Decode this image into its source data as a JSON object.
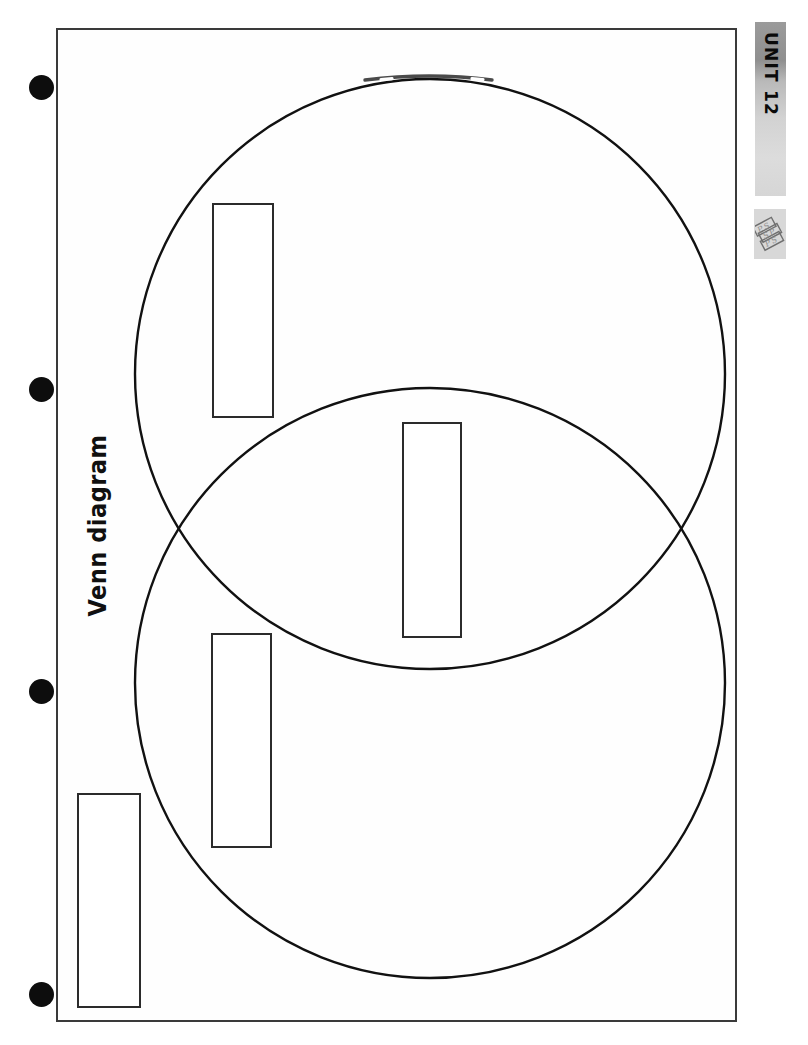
{
  "page": {
    "width": 808,
    "height": 1045,
    "background_color": "#ffffff",
    "border_color": "#3a3a3a"
  },
  "sheet": {
    "title": "Venn diagram",
    "title_rotation_degrees": -90,
    "border": {
      "x": 56,
      "y": 28,
      "width": 681,
      "height": 994
    }
  },
  "unit_tab": {
    "label": "UNIT 12",
    "rotation_degrees": 90,
    "gradient_from": "#8f8f8f",
    "gradient_to": "#dcdcdc"
  },
  "publisher_logo": {
    "name": "publisher-logo-icon",
    "alt_text": "PSP",
    "background_color": "#d8d8d8",
    "ink_color": "#6f6f6f"
  },
  "hole_punches": [
    {
      "name": "hole-punch-1",
      "cx": 41,
      "cy": 87,
      "r": 12.5,
      "color": "#0d0d0d"
    },
    {
      "name": "hole-punch-2",
      "cx": 41,
      "cy": 389,
      "r": 12.5,
      "color": "#0d0d0d"
    },
    {
      "name": "hole-punch-3",
      "cx": 41,
      "cy": 691,
      "r": 12.5,
      "color": "#0d0d0d"
    },
    {
      "name": "hole-punch-4",
      "cx": 41,
      "cy": 994,
      "r": 12.5,
      "color": "#0d0d0d"
    }
  ],
  "venn": {
    "stroke_color": "#111111",
    "stroke_width": 2.4,
    "fill": "none",
    "circles": [
      {
        "name": "venn-circle-top",
        "cx": 430,
        "cy": 374,
        "r": 295
      },
      {
        "name": "venn-circle-bottom",
        "cx": 430,
        "cy": 683,
        "r": 295
      }
    ],
    "intersection_points": [
      {
        "x": 185,
        "y": 528
      },
      {
        "x": 675,
        "y": 528
      }
    ]
  },
  "label_boxes": [
    {
      "name": "label-box-top-circle-only",
      "region": "top circle only",
      "value": "",
      "x": 212,
      "y": 203,
      "width": 62,
      "height": 215
    },
    {
      "name": "label-box-intersection",
      "region": "intersection",
      "value": "",
      "x": 402,
      "y": 422,
      "width": 60,
      "height": 216
    },
    {
      "name": "label-box-bottom-circle-only",
      "region": "bottom circle only",
      "value": "",
      "x": 211,
      "y": 633,
      "width": 61,
      "height": 215
    },
    {
      "name": "label-box-outside",
      "region": "outside both circles",
      "value": "",
      "x": 77,
      "y": 793,
      "width": 64,
      "height": 215
    }
  ]
}
